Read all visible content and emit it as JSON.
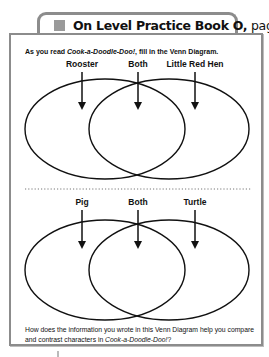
{
  "header": {
    "icon": "gray-square-icon",
    "title_bold": "On Level Practice Book O,",
    "title_page": " page 114"
  },
  "instructions": {
    "prefix": "As you read ",
    "book_title": "Cook-a-Doodle-Doo!",
    "suffix": ", fill in the Venn Diagram."
  },
  "venn_top": {
    "labels": [
      "Rooster",
      "Both",
      "Little Red Hen"
    ]
  },
  "venn_bottom": {
    "labels": [
      "Pig",
      "Both",
      "Turtle"
    ]
  },
  "question": {
    "prefix": "How does the information you wrote in this Venn Diagram help you compare and contrast characters in ",
    "book_title": "Cook-a-Doodle-Doo!",
    "suffix": "?"
  }
}
